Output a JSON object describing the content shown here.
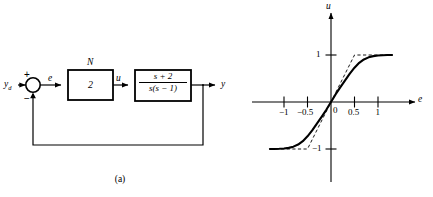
{
  "figure": {
    "panels": [
      {
        "id": "a",
        "caption": "(a)",
        "type": "block-diagram",
        "signals": {
          "reference": "y",
          "reference_sub": "d",
          "error": "e",
          "control": "u",
          "output": "y"
        },
        "summing_junction": {
          "plus_sign": "+",
          "minus_sign": "−"
        },
        "blocks": [
          {
            "name": "nonlinearity",
            "top_label": "N",
            "content": "2"
          },
          {
            "name": "plant",
            "numerator": "s + 2",
            "denominator": "s(s − 1)"
          }
        ]
      },
      {
        "id": "b",
        "caption": "(b)",
        "type": "plot"
      }
    ]
  },
  "chart_data": {
    "type": "line",
    "title": "",
    "xlabel": "e",
    "ylabel": "u",
    "xlim": [
      -1.3,
      1.3
    ],
    "ylim": [
      -1.3,
      1.3
    ],
    "grid": false,
    "legend": "none",
    "xticks": [
      -1,
      -0.5,
      0.5,
      1
    ],
    "xtick_labels": [
      "−1",
      "−0.5",
      "0.5",
      "1"
    ],
    "yticks": [
      1,
      -1
    ],
    "ytick_labels": [
      "1",
      "−1"
    ],
    "origin_label": "0",
    "series": [
      {
        "name": "smooth-sigmoid",
        "style": "solid",
        "x": [
          -1.3,
          -1.2,
          -1.1,
          -1.0,
          -0.9,
          -0.8,
          -0.7,
          -0.6,
          -0.5,
          -0.4,
          -0.3,
          -0.2,
          -0.1,
          0.0,
          0.1,
          0.2,
          0.3,
          0.4,
          0.5,
          0.6,
          0.7,
          0.8,
          0.9,
          1.0,
          1.1,
          1.2,
          1.3
        ],
        "y": [
          -1.0,
          -0.999,
          -0.996,
          -0.99,
          -0.976,
          -0.95,
          -0.905,
          -0.833,
          -0.731,
          -0.604,
          -0.462,
          -0.315,
          -0.166,
          0.0,
          0.166,
          0.315,
          0.462,
          0.604,
          0.731,
          0.833,
          0.905,
          0.95,
          0.976,
          0.99,
          0.996,
          0.999,
          1.0
        ]
      },
      {
        "name": "saturation-piecewise",
        "style": "dashed",
        "x": [
          -1.3,
          -0.5,
          0.5,
          1.3
        ],
        "y": [
          -1.0,
          -1.0,
          1.0,
          1.0
        ]
      }
    ],
    "annotations": [
      {
        "text": "u",
        "role": "y-axis-label"
      },
      {
        "text": "e",
        "role": "x-axis-label"
      }
    ]
  }
}
